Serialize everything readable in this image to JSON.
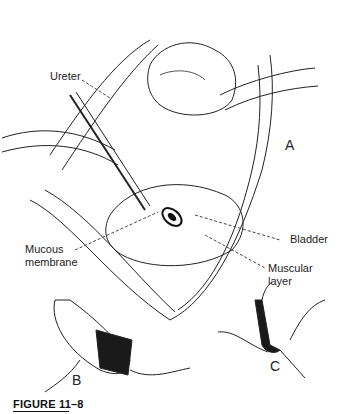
{
  "figure": {
    "caption": "FIGURE 11–8",
    "panels": [
      "A",
      "B",
      "C"
    ],
    "labels": {
      "ureter": "Ureter",
      "mucous_line1": "Mucous",
      "mucous_line2": "membrane",
      "bladder": "Bladder",
      "muscular_line1": "Muscular",
      "muscular_line2": "layer"
    }
  }
}
